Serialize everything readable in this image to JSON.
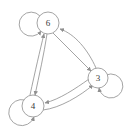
{
  "diagram": {
    "type": "directed-graph",
    "title": "",
    "background_color": "#ffffff",
    "stroke_color": "#9a9a9a",
    "node_fill_color": "#ffffff",
    "label_color": "#3a3a3a",
    "nodes": [
      {
        "id": "6",
        "label": "6",
        "cx": 48,
        "cy": 23,
        "r": 11,
        "self_loop": true,
        "self_loop_direction": "left"
      },
      {
        "id": "3",
        "label": "3",
        "cx": 98,
        "cy": 78,
        "r": 10,
        "self_loop": true,
        "self_loop_direction": "bottom-right"
      },
      {
        "id": "4",
        "label": "4",
        "cx": 33,
        "cy": 106,
        "r": 11,
        "self_loop": true,
        "self_loop_direction": "bottom-left"
      }
    ],
    "edges": [
      {
        "from": "6",
        "to": "4",
        "directed": true,
        "style": "curved"
      },
      {
        "from": "4",
        "to": "6",
        "directed": true,
        "style": "curved"
      },
      {
        "from": "6",
        "to": "3",
        "directed": true,
        "style": "straight"
      },
      {
        "from": "3",
        "to": "6",
        "directed": true,
        "style": "curved"
      },
      {
        "from": "3",
        "to": "4",
        "directed": true,
        "style": "curved"
      },
      {
        "from": "4",
        "to": "3",
        "directed": true,
        "style": "curved"
      },
      {
        "from": "6",
        "to": "6",
        "directed": true,
        "style": "self-loop"
      },
      {
        "from": "3",
        "to": "3",
        "directed": true,
        "style": "self-loop"
      },
      {
        "from": "4",
        "to": "4",
        "directed": true,
        "style": "self-loop"
      }
    ]
  }
}
